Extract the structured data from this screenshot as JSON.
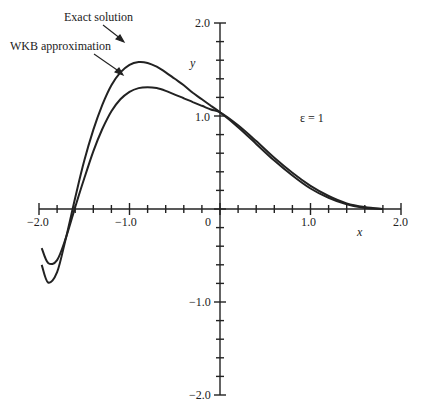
{
  "chart_data": {
    "type": "line",
    "title": "",
    "xlabel": "x",
    "ylabel": "y",
    "xlim": [
      -2.0,
      2.0
    ],
    "ylim": [
      -2.0,
      2.0
    ],
    "x_ticks": [
      "-2.0",
      "-1.0",
      "0",
      "1.0",
      "2.0"
    ],
    "y_ticks": [
      "2.0",
      "1.0",
      "-1.0",
      "-2.0"
    ],
    "minor_tick_step": 0.2,
    "grid": false,
    "annotation": "ε = 1",
    "series": [
      {
        "name": "Exact solution",
        "x": [
          -1.97,
          -1.9,
          -1.8,
          -1.7,
          -1.6,
          -1.5,
          -1.4,
          -1.3,
          -1.2,
          -1.1,
          -1.0,
          -0.9,
          -0.8,
          -0.7,
          -0.6,
          -0.5,
          -0.4,
          -0.3,
          -0.2,
          -0.1,
          0.0,
          0.2,
          0.4,
          0.6,
          0.8,
          1.0,
          1.2,
          1.4,
          1.6,
          1.8
        ],
        "y": [
          -0.6,
          -0.79,
          -0.68,
          -0.3,
          0.12,
          0.52,
          0.85,
          1.12,
          1.33,
          1.47,
          1.55,
          1.58,
          1.57,
          1.53,
          1.47,
          1.4,
          1.33,
          1.25,
          1.18,
          1.11,
          1.04,
          0.88,
          0.7,
          0.52,
          0.36,
          0.22,
          0.12,
          0.05,
          0.01,
          0.0
        ]
      },
      {
        "name": "WKB approximation",
        "x": [
          -1.97,
          -1.9,
          -1.8,
          -1.7,
          -1.6,
          -1.5,
          -1.4,
          -1.3,
          -1.2,
          -1.1,
          -1.0,
          -0.9,
          -0.8,
          -0.7,
          -0.6,
          -0.5,
          -0.4,
          -0.3,
          -0.2,
          -0.1,
          0.0,
          0.2,
          0.4,
          0.6,
          0.8,
          1.0,
          1.2,
          1.4,
          1.6,
          1.8
        ],
        "y": [
          -0.42,
          -0.58,
          -0.55,
          -0.3,
          0.02,
          0.33,
          0.62,
          0.86,
          1.05,
          1.18,
          1.26,
          1.3,
          1.31,
          1.3,
          1.27,
          1.23,
          1.19,
          1.15,
          1.11,
          1.07,
          1.04,
          0.9,
          0.73,
          0.55,
          0.39,
          0.25,
          0.14,
          0.06,
          0.02,
          0.0
        ]
      }
    ],
    "legend": "annotated with arrows",
    "legend_position": "upper-left (arrow labels)"
  },
  "labels": {
    "exact": "Exact solution",
    "wkb": "WKB approximation",
    "epsilon": "ε = 1",
    "x_axis": "x",
    "y_axis": "y",
    "xt_m2": "−2.0",
    "xt_m1": "−1.0",
    "xt_0": "0",
    "xt_1": "1.0",
    "xt_2": "2.0",
    "yt_2": "2.0",
    "yt_1": "1.0",
    "yt_m1": "−1.0",
    "yt_m2": "−2.0"
  }
}
